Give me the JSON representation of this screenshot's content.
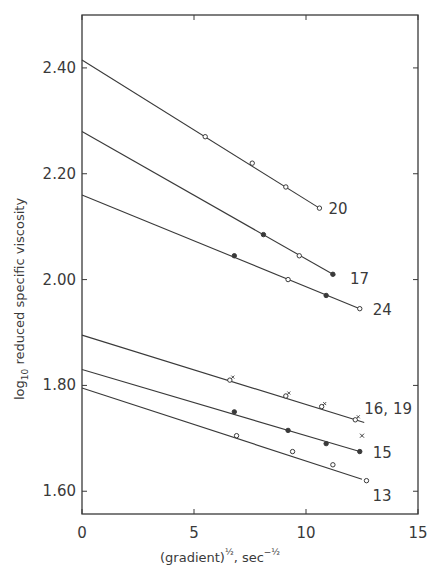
{
  "chart_data": {
    "type": "line",
    "title": "",
    "xlabel": "(gradient)^1/2, sec^-1/2",
    "xlabel_parts": {
      "base": "(gradient)",
      "sup1": "½",
      "mid": ", sec",
      "sup2": "−½"
    },
    "ylabel": "log10 reduced specific viscosity",
    "ylabel_parts": {
      "pre": "log",
      "sub": "10",
      "post": " reduced specific viscosity"
    },
    "xlim": [
      0,
      15
    ],
    "ylim": [
      1.557,
      2.5
    ],
    "x_ticks": [
      "0",
      "5",
      "10",
      "15"
    ],
    "x_tick_values": [
      0,
      5,
      10,
      15
    ],
    "y_ticks": [
      "2.40",
      "2.20",
      "2.00",
      "1.80",
      "1.60"
    ],
    "y_tick_values": [
      2.4,
      2.2,
      2.0,
      1.8,
      1.6
    ],
    "grid": false,
    "legend": "inline labels at line ends",
    "series": [
      {
        "name": "20",
        "intercept": 2.415,
        "line_end_x": 10.6,
        "x": [
          5.5,
          7.6,
          9.1,
          10.6
        ],
        "y": [
          2.27,
          2.22,
          2.175,
          2.135
        ],
        "marker": "open circle"
      },
      {
        "name": "17",
        "intercept": 2.28,
        "line_end_x": 11.3,
        "x": [
          8.1,
          9.7,
          11.2
        ],
        "y": [
          2.085,
          2.045,
          2.01
        ],
        "marker": "open/filled circle"
      },
      {
        "name": "24",
        "intercept": 2.16,
        "line_end_x": 12.4,
        "x": [
          6.8,
          9.2,
          10.9,
          12.4
        ],
        "y": [
          2.045,
          2.0,
          1.97,
          1.945
        ],
        "marker": "open/filled circle"
      },
      {
        "name": "16, 19",
        "intercept": 1.895,
        "line_end_x": 12.6,
        "x": [
          6.6,
          9.1,
          10.7,
          12.2
        ],
        "y": [
          1.81,
          1.78,
          1.76,
          1.735
        ],
        "marker": "open circle + cross"
      },
      {
        "name": "15",
        "intercept": 1.83,
        "line_end_x": 12.4,
        "x": [
          6.8,
          9.2,
          10.9,
          12.4
        ],
        "y": [
          1.75,
          1.715,
          1.69,
          1.675
        ],
        "marker": "filled/open circle"
      },
      {
        "name": "13",
        "intercept": 1.795,
        "line_end_x": 12.5,
        "x": [
          6.9,
          9.4,
          11.2,
          12.7
        ],
        "y": [
          1.705,
          1.675,
          1.65,
          1.62
        ],
        "marker": "open circle"
      }
    ],
    "extra_markers": [
      {
        "series": "16, 19",
        "x": 12.5,
        "y": 1.705,
        "marker": "cross"
      }
    ]
  }
}
